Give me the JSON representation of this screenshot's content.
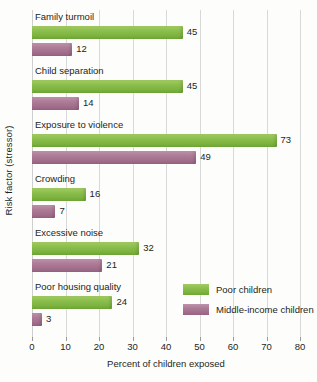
{
  "chart_data": {
    "type": "bar",
    "orientation": "horizontal",
    "title": "",
    "xlabel": "Percent of children exposed",
    "ylabel": "Risk factor (stressor)",
    "xlim": [
      0,
      80
    ],
    "xticks": [
      0,
      10,
      20,
      30,
      40,
      50,
      60,
      70,
      80
    ],
    "grid": true,
    "legend_position": "inside-bottom-right",
    "categories": [
      "Family turmoil",
      "Child separation",
      "Exposure to violence",
      "Crowding",
      "Excessive noise",
      "Poor housing quality"
    ],
    "series": [
      {
        "name": "Poor children",
        "color": "#7eb441",
        "values": [
          45,
          45,
          73,
          16,
          32,
          24
        ]
      },
      {
        "name": "Middle-income children",
        "color": "#a26f8c",
        "values": [
          12,
          14,
          49,
          7,
          21,
          3
        ]
      }
    ]
  },
  "colors": {
    "poor_children": "#7eb441",
    "middle_income_children": "#a26f8c",
    "gridline": "#d9d9d9",
    "text": "#231f20",
    "background": "#fdfdfc"
  }
}
